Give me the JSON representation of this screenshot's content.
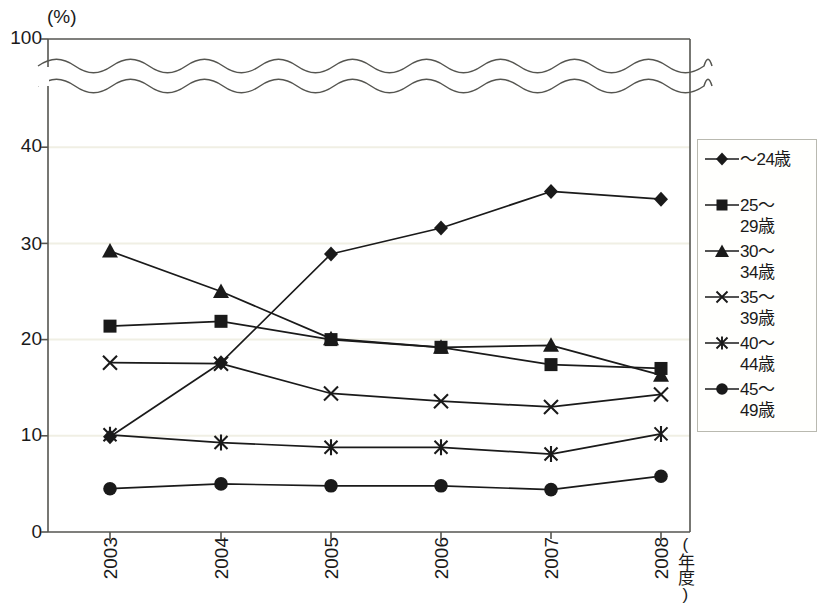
{
  "chart_data": {
    "type": "line",
    "title": "",
    "subtitle": "",
    "xlabel": "(年度)",
    "ylabel": "(%)",
    "x": [
      "2003",
      "2004",
      "2005",
      "2006",
      "2007",
      "2008"
    ],
    "categories": [
      "2003",
      "2004",
      "2005",
      "2006",
      "2007",
      "2008"
    ],
    "ylim": [
      0,
      100
    ],
    "yticks": [
      0,
      10,
      20,
      30,
      40,
      100
    ],
    "ytick_labels": [
      "0",
      "10",
      "20",
      "30",
      "40",
      "100"
    ],
    "axis_break": {
      "present": true,
      "between": [
        40,
        100
      ],
      "style": "double-wave"
    },
    "grid": "horizontal-light",
    "legend_position": "right-outside",
    "series": [
      {
        "name": "～24歳",
        "label_lines": [
          "～24歳"
        ],
        "marker": "diamond",
        "values": [
          9.9,
          17.6,
          28.9,
          31.6,
          35.4,
          34.6
        ]
      },
      {
        "name": "25～29歳",
        "label_lines": [
          "25～",
          "29歳"
        ],
        "marker": "square",
        "values": [
          21.4,
          21.9,
          20.0,
          19.2,
          17.4,
          17.0
        ]
      },
      {
        "name": "30～34歳",
        "label_lines": [
          "30～",
          "34歳"
        ],
        "marker": "triangle",
        "values": [
          29.2,
          25.0,
          20.1,
          19.2,
          19.4,
          16.3
        ]
      },
      {
        "name": "35～39歳",
        "label_lines": [
          "35～",
          "39歳"
        ],
        "marker": "cross",
        "values": [
          17.6,
          17.5,
          14.4,
          13.6,
          13.0,
          14.3
        ]
      },
      {
        "name": "40～44歳",
        "label_lines": [
          "40～",
          "44歳"
        ],
        "marker": "asterisk",
        "values": [
          10.1,
          9.3,
          8.8,
          8.8,
          8.1,
          10.2
        ]
      },
      {
        "name": "45～49歳",
        "label_lines": [
          "45～",
          "49歳"
        ],
        "marker": "circle",
        "values": [
          4.5,
          5.0,
          4.8,
          4.8,
          4.4,
          5.8
        ]
      }
    ]
  },
  "colors": {
    "ink": "#1a1a1a",
    "axis": "#555550",
    "grid": "#f0efe4",
    "legend_border": "#b9b9b0",
    "background": "#ffffff"
  }
}
